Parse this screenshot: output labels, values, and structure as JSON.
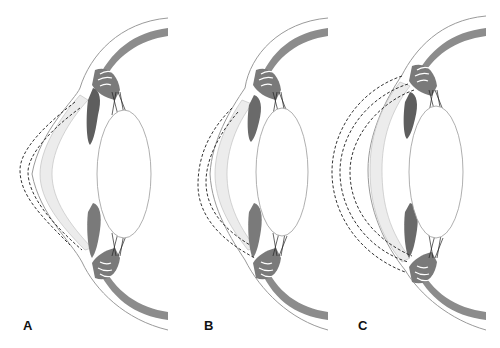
{
  "figure": {
    "type": "anatomical cross-section diagram of the anterior eye (cornea, iris, ciliary body, lens, sclera)",
    "panels": [
      {
        "label": "A",
        "description": "Cornea with two dashed outlines showing a more protruding, pointed anterior curvature"
      },
      {
        "label": "B",
        "description": "Cornea with two dashed outlines showing a moderately steepened lower curvature"
      },
      {
        "label": "C",
        "description": "Cornea with three dashed outlines showing a broadly enlarged, globular anterior curvature"
      }
    ]
  },
  "colors": {
    "sclera_band": "#8c8c8c",
    "iris": "#6e6e6e",
    "cornea_fill": "#ececec",
    "outline": "#9a9a9a",
    "dashed": "#333333",
    "label": "#111111"
  }
}
